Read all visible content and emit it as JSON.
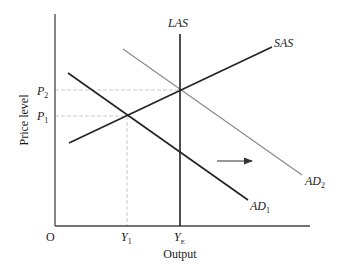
{
  "diagram": {
    "type": "AD-AS model",
    "colors": {
      "axis": "#444444",
      "curve": "#222222",
      "shifted_curve": "#8a8a8a",
      "guide": "#c8c8c8",
      "background": "#ffffff"
    },
    "axes": {
      "origin_label": "O",
      "x_label": "Output",
      "y_label": "Price level",
      "x_ticks": [
        {
          "main": "Y",
          "sub": "1"
        },
        {
          "main": "Y",
          "sub": "E"
        }
      ],
      "y_ticks": [
        {
          "main": "P",
          "sub": "2"
        },
        {
          "main": "P",
          "sub": "1"
        }
      ]
    },
    "curves": {
      "las": {
        "label": "LAS"
      },
      "sas": {
        "label": "SAS"
      },
      "ad1": {
        "main": "AD",
        "sub": "1"
      },
      "ad2": {
        "main": "AD",
        "sub": "2"
      }
    },
    "annotations": {
      "shift_arrow": "rightward shift of aggregate demand"
    }
  }
}
